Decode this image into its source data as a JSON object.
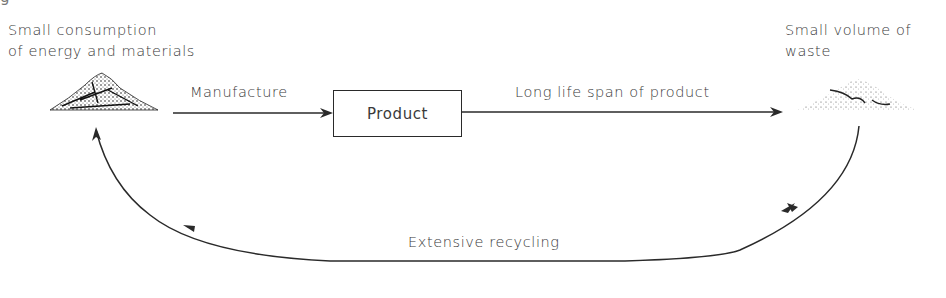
{
  "diagram": {
    "top_cut_text": "                          g",
    "nodes": {
      "source": {
        "label_line1": "Small consumption",
        "label_line2": "of energy and materials",
        "icon": "material-pile-icon"
      },
      "product": {
        "label": "Product"
      },
      "waste": {
        "label_line1": "Small volume of",
        "label_line2": "waste",
        "icon": "waste-pile-icon"
      }
    },
    "edges": [
      {
        "from": "source",
        "to": "product",
        "label": "Manufacture"
      },
      {
        "from": "product",
        "to": "waste",
        "label": "Long life span of product"
      },
      {
        "from": "waste",
        "to": "source",
        "label": "Extensive recycling"
      }
    ],
    "colors": {
      "line": "#2a2a2a",
      "text": "#3a3a3a",
      "background": "#ffffff"
    }
  }
}
